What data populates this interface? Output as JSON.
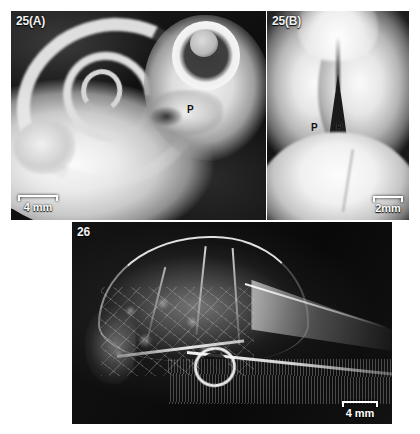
{
  "figure": {
    "background_color": "#ffffff",
    "panel_background_color": "#101010",
    "label_color": "#f2f2f2",
    "scalebar_color": "#ffffff",
    "marker_color": "#111111"
  },
  "panels": [
    {
      "id": "25a",
      "label": "25(A)",
      "subject": "whole embryo, lateral view",
      "markers": [
        {
          "text": "P",
          "name": "palate-marker-a"
        }
      ],
      "scalebar": {
        "text": "4 mm",
        "position": "bottom-left"
      }
    },
    {
      "id": "25b",
      "label": "25(B)",
      "subject": "palatal view showing midline cleft",
      "markers": [
        {
          "text": "P",
          "name": "palatal-shelf-marker-left"
        },
        {
          "text": "P",
          "name": "palatal-shelf-marker-right"
        }
      ],
      "scalebar": {
        "text": "2mm",
        "position": "bottom-right"
      }
    },
    {
      "id": "26",
      "label": "26",
      "subject": "skull radiograph, lateral view",
      "markers": [],
      "scalebar": {
        "text": "4 mm",
        "position": "bottom-right"
      }
    }
  ]
}
